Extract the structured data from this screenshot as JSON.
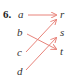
{
  "problem": {
    "number": "6.",
    "domain": [
      "a",
      "b",
      "c",
      "d"
    ],
    "range": [
      "r",
      "s",
      "t"
    ],
    "mappings": [
      {
        "from": "a",
        "to": "r"
      },
      {
        "from": "b",
        "to": "t"
      },
      {
        "from": "c",
        "to": "r"
      },
      {
        "from": "d",
        "to": "s"
      }
    ],
    "arrow_color": "#e8837a"
  }
}
